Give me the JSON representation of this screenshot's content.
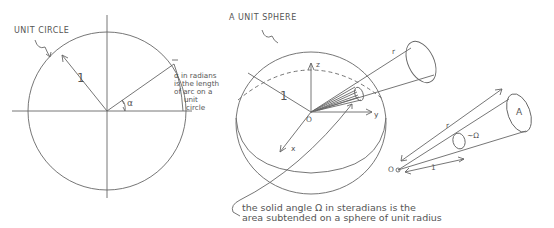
{
  "unit_circle": {
    "title": "UNIT CIRCLE",
    "radius_label": "1",
    "angle_label": "α",
    "note_lines": [
      "α in radians",
      "is the length",
      "of arc on a",
      "unit",
      "circle"
    ]
  },
  "unit_sphere": {
    "title": "A UNIT SPHERE",
    "radius_label": "1",
    "axis_z": "z",
    "axis_y": "y",
    "axis_x": "x",
    "origin": "O",
    "cone_length_label": "r"
  },
  "cone_detail": {
    "origin": "O",
    "distance_r": "r",
    "unit_distance": "1",
    "solid_angle": "~Ω",
    "area_label": "A"
  },
  "caption": {
    "lines": [
      "the solid angle Ω in steradians is the",
      "area subtended on a sphere of unit radius"
    ]
  },
  "colors": {
    "ink": "#555555",
    "background": "#ffffff"
  }
}
